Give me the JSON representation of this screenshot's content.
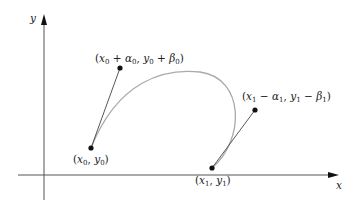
{
  "diagram": {
    "type": "hermite-curve",
    "axes": {
      "x_label": "x",
      "y_label": "y",
      "color": "#555555"
    },
    "curve": {
      "color": "#aaaaaa"
    },
    "tangent_color": "#444444",
    "point_color": "#111111",
    "points": {
      "p0": {
        "label": "(x0, y0)",
        "parts": [
          "(",
          "x",
          "0",
          ", ",
          "y",
          "0",
          ")"
        ]
      },
      "c0": {
        "label": "(x0 + α0, y0 + β0)",
        "parts": [
          "(",
          "x",
          "0",
          " + ",
          "α",
          "0",
          ", ",
          "y",
          "0",
          " + ",
          "β",
          "0",
          ")"
        ]
      },
      "p1": {
        "label": "(x1, y1)",
        "parts": [
          "(",
          "x",
          "1",
          ", ",
          "y",
          "1",
          ")"
        ]
      },
      "c1": {
        "label": "(x1 − α1, y1 − β1)",
        "parts": [
          "(",
          "x",
          "1",
          " − ",
          "α",
          "1",
          ", ",
          "y",
          "1",
          " − ",
          "β",
          "1",
          ")"
        ]
      }
    }
  }
}
